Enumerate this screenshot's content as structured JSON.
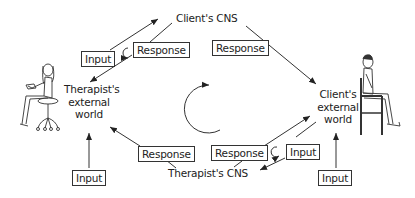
{
  "diagram": {
    "nodes": {
      "client_cns": "Client's CNS",
      "therapist_cns": "Therapist's CNS",
      "therapist_world": [
        "Therapist's",
        "external",
        "world"
      ],
      "client_world": [
        "Client's",
        "external",
        "world"
      ]
    },
    "boxes": {
      "top_left_input": "Input",
      "top_left_response": "Response",
      "top_right_response": "Response",
      "bottom_left_response": "Response",
      "bottom_right_response": "Response",
      "bottom_right_input": "Input",
      "therapist_input": "Input",
      "client_input": "Input"
    },
    "figures": {
      "left": "therapist-seated-on-stool",
      "right": "client-seated-on-chair"
    },
    "center": "clockwise-cycle-arrow"
  }
}
